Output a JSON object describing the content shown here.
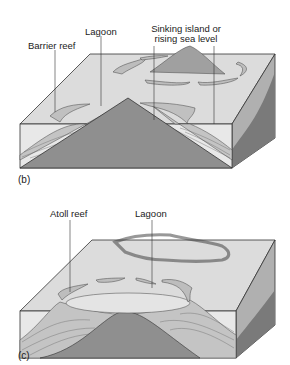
{
  "panels": [
    {
      "id": "b",
      "caption": "(b)",
      "labels": {
        "barrier_reef": "Barrier reef",
        "lagoon": "Lagoon",
        "sinking_line1": "Sinking island or",
        "sinking_line2": "rising sea level"
      }
    },
    {
      "id": "c",
      "caption": "(c)",
      "labels": {
        "atoll_reef": "Atoll reef",
        "lagoon": "Lagoon"
      }
    }
  ],
  "colors": {
    "water": "#d9d9d9",
    "side_water": "#e6e6e6",
    "volcano": "#8f8f8f",
    "reef": "#b8b8b8",
    "right_side": "#a8a8a8",
    "outline": "#333333"
  }
}
